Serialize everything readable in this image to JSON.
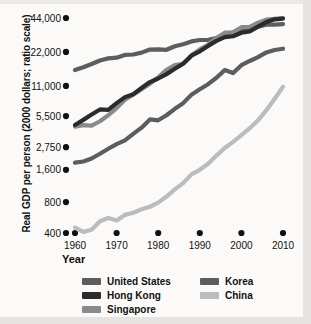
{
  "chart_data": {
    "type": "line",
    "title": "",
    "xlabel": "Year",
    "ylabel": "Real GDP per person (2000 dollars; ratio scale)",
    "scale": "ratio (log) scale",
    "grid": false,
    "legend_position": "below-axis",
    "xlim": [
      1960,
      2010
    ],
    "ylim": [
      400,
      44000
    ],
    "x_ticks": [
      1960,
      1970,
      1980,
      1990,
      2000,
      2010
    ],
    "x_tick_labels": [
      "1960",
      "1970",
      "1980",
      "1990",
      "2000",
      "2010"
    ],
    "y_ticks": [
      400,
      800,
      1600,
      2750,
      5500,
      11000,
      22000,
      44000
    ],
    "y_tick_labels": [
      "400",
      "800",
      "1,600",
      "2,750",
      "5,500",
      "11,000",
      "22,000",
      "44,000"
    ],
    "y_tick_pixel_fraction": [
      1.0,
      0.856,
      0.706,
      0.601,
      0.456,
      0.316,
      0.158,
      0.0
    ],
    "x": [
      1960,
      1962,
      1964,
      1966,
      1968,
      1970,
      1972,
      1974,
      1976,
      1978,
      1980,
      1982,
      1984,
      1986,
      1988,
      1990,
      1992,
      1994,
      1996,
      1998,
      2000,
      2002,
      2004,
      2006,
      2008,
      2010
    ],
    "series": [
      {
        "name": "United States",
        "color": "#5d5d5d",
        "values": [
          15200,
          16100,
          17200,
          18500,
          19300,
          19600,
          20700,
          20900,
          21700,
          23100,
          23200,
          23000,
          24700,
          25800,
          27300,
          28100,
          28200,
          29300,
          30900,
          32900,
          35000,
          35300,
          36900,
          38400,
          38500,
          38900
        ]
      },
      {
        "name": "Hong Kong",
        "color": "#2b2b2b",
        "values": [
          4500,
          5050,
          5700,
          6400,
          6350,
          7400,
          8500,
          9100,
          10500,
          11900,
          12800,
          14000,
          15600,
          17300,
          20400,
          22300,
          24900,
          27600,
          29800,
          30300,
          32600,
          33500,
          36900,
          40500,
          42800,
          43500
        ]
      },
      {
        "name": "Singapore",
        "color": "#8a8a8a",
        "values": [
          4350,
          4500,
          4450,
          4900,
          5600,
          6600,
          8000,
          9000,
          10200,
          11500,
          13100,
          15300,
          16800,
          17300,
          20600,
          23200,
          25500,
          29300,
          32600,
          32800,
          36500,
          36800,
          40000,
          42500,
          43200,
          44000
        ]
      },
      {
        "name": "Korea",
        "color": "#5d5d5d",
        "values": [
          1900,
          1950,
          2100,
          2350,
          2650,
          2950,
          3200,
          3700,
          4250,
          5100,
          5000,
          5600,
          6500,
          7400,
          9000,
          10200,
          11400,
          13000,
          15200,
          14300,
          16800,
          18300,
          19800,
          21800,
          22900,
          23500
        ]
      },
      {
        "name": "China",
        "color": "#bcbcbc",
        "values": [
          450,
          410,
          430,
          520,
          560,
          530,
          600,
          630,
          680,
          720,
          790,
          900,
          1050,
          1200,
          1450,
          1600,
          1850,
          2250,
          2700,
          3100,
          3600,
          4200,
          5000,
          6300,
          8200,
          10800
        ]
      }
    ]
  },
  "legend": {
    "columns": [
      {
        "items": [
          {
            "label": "United States",
            "color": "#5d5d5d"
          },
          {
            "label": "Hong Kong",
            "color": "#2b2b2b"
          },
          {
            "label": "Singapore",
            "color": "#8a8a8a"
          }
        ]
      },
      {
        "items": [
          {
            "label": "Korea",
            "color": "#5d5d5d"
          },
          {
            "label": "China",
            "color": "#bcbcbc"
          }
        ]
      }
    ]
  }
}
